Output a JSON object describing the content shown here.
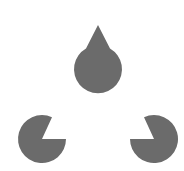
{
  "figure": {
    "fill_color": "#6b6b6b",
    "background_color": "#ffffff",
    "shapes": [
      {
        "name": "top",
        "cx": 98,
        "cy": 27,
        "r": 24,
        "notch": "down"
      },
      {
        "name": "bottom-left",
        "cx": 42,
        "cy": 139,
        "r": 24,
        "notch": "up-right"
      },
      {
        "name": "bottom-right",
        "cx": 154,
        "cy": 139,
        "r": 24,
        "notch": "up-left"
      }
    ]
  }
}
